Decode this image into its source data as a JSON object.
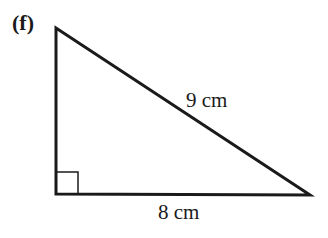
{
  "part_label": "(f)",
  "triangle": {
    "hypotenuse_label": "9 cm",
    "base_label": "8 cm",
    "right_angle_marker": true,
    "vertices": {
      "top": [
        56,
        28
      ],
      "bottom_left": [
        56,
        194
      ],
      "bottom_right": [
        310,
        195
      ]
    }
  },
  "colors": {
    "stroke": "#1a1a1a",
    "background": "#ffffff"
  }
}
